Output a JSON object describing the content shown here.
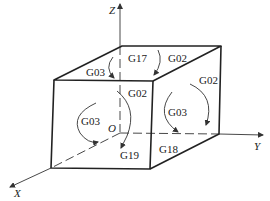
{
  "diagram": {
    "title": "",
    "colors": {
      "line": "#222222",
      "background": "#ffffff"
    },
    "axes": {
      "z": {
        "label": "Z"
      },
      "y": {
        "label": "Y"
      },
      "x": {
        "label": "X"
      },
      "origin": {
        "label": "O"
      }
    },
    "faces": {
      "top": {
        "plane_label": "G17",
        "left_label": "G03",
        "right_label": "G02"
      },
      "front": {
        "plane_label": "G19",
        "top_label": "G02",
        "left_label": "G03"
      },
      "side": {
        "plane_label": "G18",
        "top_label": "G02",
        "center_label": "G03"
      }
    }
  }
}
